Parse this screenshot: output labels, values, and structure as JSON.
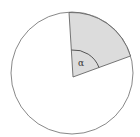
{
  "diagram": {
    "type": "circle-sector",
    "angle_label": "α",
    "colors": {
      "circle_stroke": "#7a7a7a",
      "circle_fill": "#ffffff",
      "sector_fill": "#dcdcdc",
      "sector_stroke": "#555555",
      "arc_stroke": "#444444"
    }
  }
}
